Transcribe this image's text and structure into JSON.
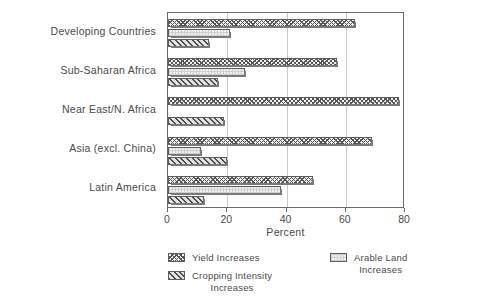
{
  "chart_data": {
    "type": "bar",
    "orientation": "horizontal",
    "title": "",
    "xlabel": "Percent",
    "ylabel": "",
    "xlim": [
      0,
      80
    ],
    "xticks": [
      0,
      20,
      40,
      60,
      80
    ],
    "xtick_labels": [
      "0",
      "20",
      "40",
      "60",
      "80"
    ],
    "grid": true,
    "grid_axis": "x",
    "legend_position": "bottom",
    "categories": [
      "Developing Countries",
      "Sub-Saharan Africa",
      "Near East/N. Africa",
      "Asia (excl. China)",
      "Latin America"
    ],
    "series": [
      {
        "name": "Yield Increases",
        "pattern": "cross-hatch",
        "values": [
          63,
          57,
          78,
          69,
          49
        ]
      },
      {
        "name": "Arable Land Increases",
        "pattern": "light-dotted",
        "values": [
          21,
          26,
          0,
          11,
          38
        ]
      },
      {
        "name": "Cropping Intensity Increases",
        "pattern": "diagonal-hatch",
        "values": [
          14,
          17,
          19,
          20,
          12
        ]
      }
    ]
  },
  "legend": {
    "items": [
      {
        "label": "Yield Increases",
        "swatch": "cross-hatch-swatch"
      },
      {
        "label": "Cropping Intensity\nIncreases",
        "swatch": "diagonal-hatch-swatch"
      },
      {
        "label": "Arable Land\nIncreases",
        "swatch": "light-dotted-swatch"
      }
    ]
  },
  "colors": {
    "axis": "#6b6b6b",
    "grid": "#c9c9c9",
    "text": "#4a4a4a",
    "bar_outline": "#5d5d5d",
    "background": "#ffffff"
  }
}
